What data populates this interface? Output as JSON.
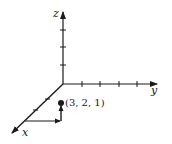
{
  "diagram": {
    "axes": {
      "x": {
        "label": "x"
      },
      "y": {
        "label": "y"
      },
      "z": {
        "label": "z"
      }
    },
    "point": {
      "label": "(3, 2, 1)",
      "coords": [
        3,
        2,
        1
      ]
    },
    "colors": {
      "stroke": "#1a1a1a",
      "background": "#ffffff"
    }
  }
}
